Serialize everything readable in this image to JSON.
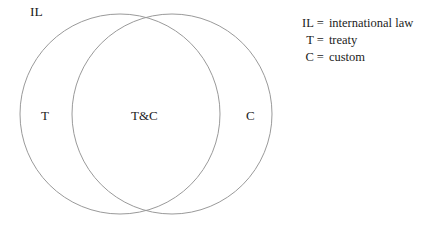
{
  "figure": {
    "type": "venn-diagram",
    "universe_label": "IL",
    "background_color": "#ffffff",
    "stroke_color": "#9a9a9a"
  },
  "sets": {
    "left": {
      "label": "T",
      "name": "treaty-set"
    },
    "right": {
      "label": "C",
      "name": "custom-set"
    },
    "intersection": {
      "label": "T&C",
      "name": "treaty-and-custom-set"
    }
  },
  "legend": {
    "rows": [
      {
        "symbol": "IL",
        "equals": "=",
        "definition": "international law"
      },
      {
        "symbol": "T",
        "equals": "=",
        "definition": "treaty"
      },
      {
        "symbol": "C",
        "equals": "=",
        "definition": "custom"
      }
    ]
  }
}
